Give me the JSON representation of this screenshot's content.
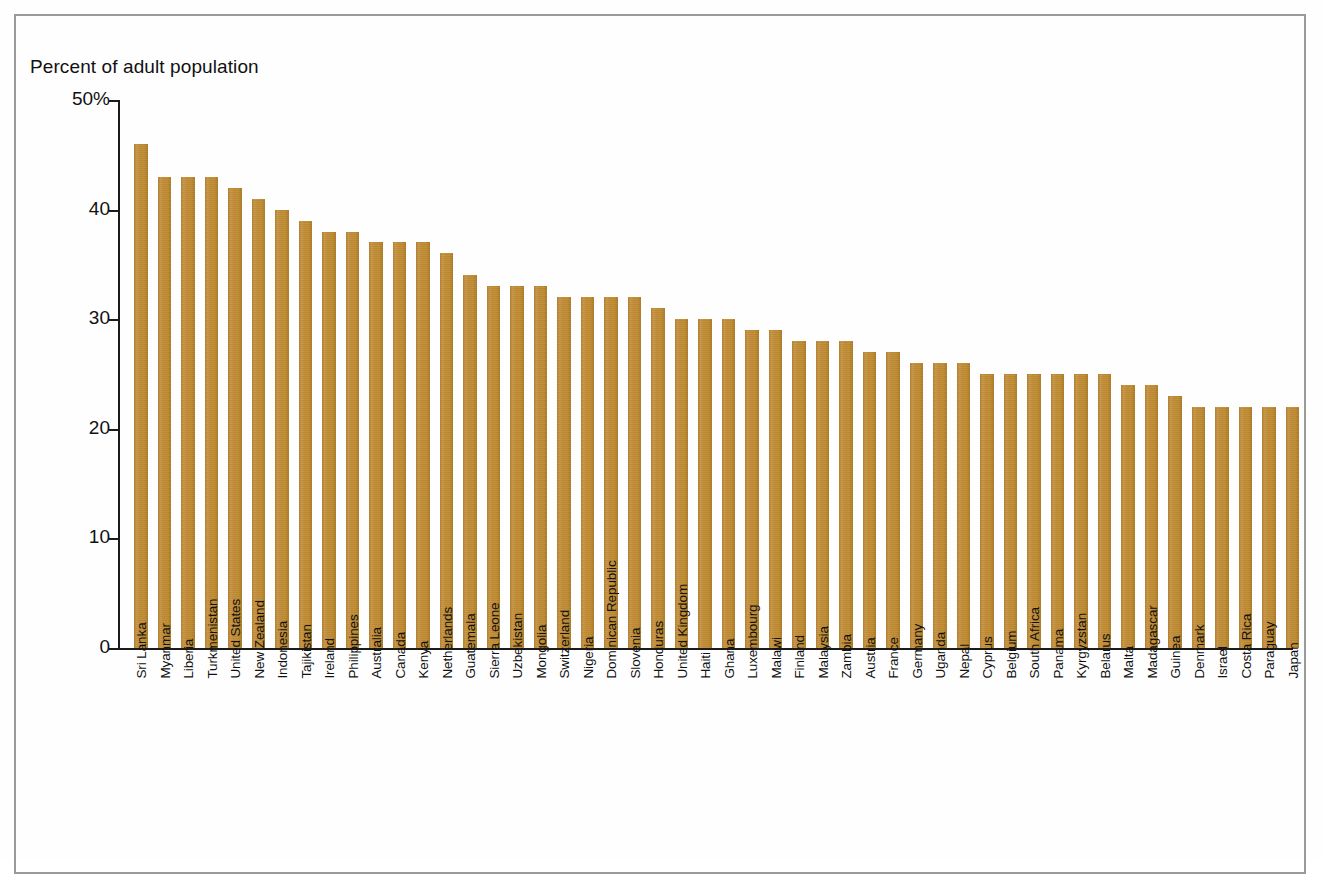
{
  "figure": {
    "axis_title": "Percent of adult population",
    "bar_color": "#c08c30",
    "axis_color": "#1b1b1b",
    "frame_color": "#9a9a9a"
  },
  "chart_data": {
    "type": "bar",
    "title": "",
    "subtitle": "",
    "xlabel": "",
    "ylabel": "Percent of adult population",
    "ylim": [
      0,
      50
    ],
    "yticks": [
      0,
      10,
      20,
      30,
      40,
      50
    ],
    "ytick_labels": [
      "0",
      "10",
      "20",
      "30",
      "40",
      "50%"
    ],
    "grid": false,
    "legend": "none",
    "orientation": "vertical",
    "categories": [
      "Sri Lanka",
      "Myanmar",
      "Liberia",
      "Turkmenistan",
      "United States",
      "New Zealand",
      "Indonesia",
      "Tajikistan",
      "Ireland",
      "Philippines",
      "Australia",
      "Canada",
      "Kenya",
      "Netherlands",
      "Guatemala",
      "Sierra Leone",
      "Uzbekistan",
      "Mongolia",
      "Switzerland",
      "Nigeria",
      "Dominican Republic",
      "Slovenia",
      "Honduras",
      "United Kingdom",
      "Haiti",
      "Ghana",
      "Luxembourg",
      "Malawi",
      "Finland",
      "Malaysia",
      "Zambia",
      "Austria",
      "France",
      "Germany",
      "Uganda",
      "Nepal",
      "Cyprus",
      "Belgium",
      "South Africa",
      "Panama",
      "Kyrgyzstan",
      "Belarus",
      "Malta",
      "Madagascar",
      "Guinea",
      "Denmark",
      "Israel",
      "Costa Rica",
      "Paraguay",
      "Japan"
    ],
    "values": [
      46,
      43,
      43,
      43,
      42,
      41,
      40,
      39,
      38,
      38,
      37,
      37,
      37,
      36,
      34,
      33,
      33,
      33,
      32,
      32,
      32,
      32,
      31,
      30,
      30,
      30,
      29,
      29,
      28,
      28,
      28,
      27,
      27,
      26,
      26,
      26,
      25,
      25,
      25,
      25,
      25,
      25,
      24,
      24,
      23,
      22,
      22,
      22,
      22,
      22
    ],
    "units": "percent"
  }
}
